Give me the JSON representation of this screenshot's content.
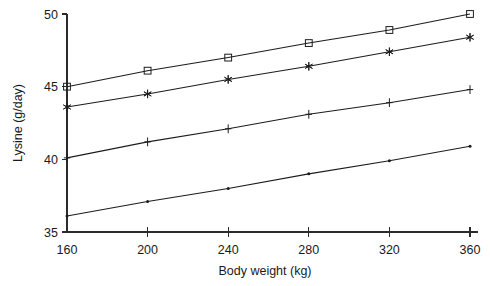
{
  "chart_data": {
    "type": "line",
    "title": "",
    "xlabel": "Body weight (kg)",
    "ylabel": "Lysine (g/day)",
    "x": [
      160,
      200,
      240,
      280,
      320,
      360
    ],
    "xlim": [
      160,
      360
    ],
    "ylim": [
      35,
      50
    ],
    "xticks": [
      "160",
      "200",
      "240",
      "280",
      "320",
      "360"
    ],
    "yticks": [
      "35",
      "40",
      "45",
      "50"
    ],
    "grid": false,
    "legend": "none",
    "series": [
      {
        "name": "series-squares",
        "marker": "open-square",
        "values": [
          45.0,
          46.1,
          47.0,
          48.0,
          48.9,
          50.0
        ]
      },
      {
        "name": "series-asterisks",
        "marker": "asterisk",
        "values": [
          43.6,
          44.5,
          45.5,
          46.4,
          47.4,
          48.4
        ]
      },
      {
        "name": "series-plus",
        "marker": "plus",
        "values": [
          40.1,
          41.2,
          42.1,
          43.1,
          43.9,
          44.8
        ]
      },
      {
        "name": "series-dots",
        "marker": "dot",
        "values": [
          36.1,
          37.1,
          38.0,
          39.0,
          39.9,
          40.9
        ]
      }
    ]
  },
  "axis": {
    "x_title": "Body weight (kg)",
    "y_title": "Lysine (g/day)",
    "x_tick_labels": [
      "160",
      "200",
      "240",
      "280",
      "320",
      "360"
    ],
    "y_tick_labels": [
      "35",
      "40",
      "45",
      "50"
    ]
  },
  "colors": {
    "line": "#1c1c1c",
    "axis": "#2b2b2b",
    "background": "#ffffff",
    "text": "#1a1a1a"
  }
}
